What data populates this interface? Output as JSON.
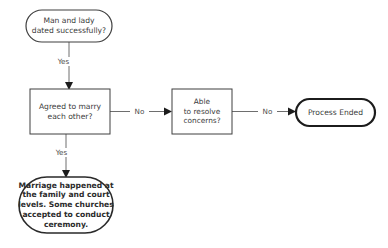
{
  "diagram": {
    "background_color": "#ffffff",
    "line_color": "#6e6e6e",
    "node_border_color": "#3f3f3f",
    "text_color": "#3b3b3b",
    "nodes": [
      {
        "id": "start",
        "shape": "stadium",
        "label": "Man and lady\ndated successfully?"
      },
      {
        "id": "agreed",
        "shape": "rectangle",
        "label": "Agreed to marry\neach other?"
      },
      {
        "id": "resolve",
        "shape": "rectangle",
        "label": "Able\nto resolve\nconcerns?"
      },
      {
        "id": "process-ended",
        "shape": "stadium",
        "label": "Process Ended"
      },
      {
        "id": "marriage-happened",
        "shape": "stadium",
        "label": "Marriage happened at\nthe family and court\nlevels. Some churches\naccepted to conduct\nceremony."
      }
    ],
    "edges": [
      {
        "id": "start-to-agreed",
        "from": "start",
        "to": "agreed",
        "label": "Yes"
      },
      {
        "id": "agreed-to-resolve",
        "from": "agreed",
        "to": "resolve",
        "label": "No"
      },
      {
        "id": "resolve-to-ended",
        "from": "resolve",
        "to": "process-ended",
        "label": "No"
      },
      {
        "id": "agreed-to-marriage",
        "from": "agreed",
        "to": "marriage-happened",
        "label": "Yes"
      }
    ]
  }
}
